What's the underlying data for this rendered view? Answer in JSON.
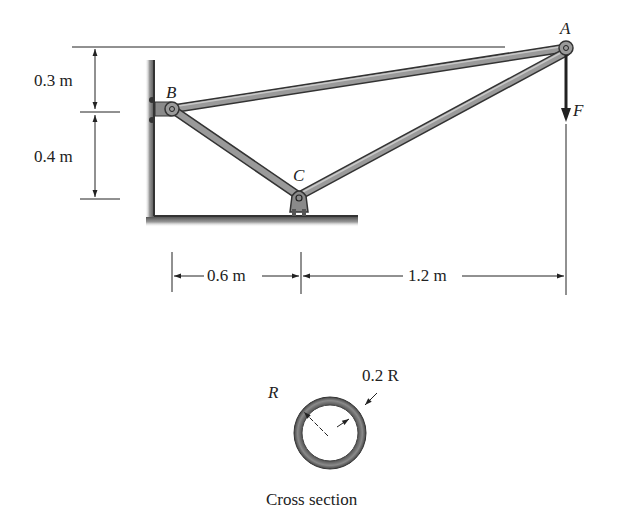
{
  "figure": {
    "type": "truss_frame",
    "points": {
      "A": {
        "label": "A"
      },
      "B": {
        "label": "B"
      },
      "C": {
        "label": "C"
      }
    },
    "load": {
      "label": "F",
      "direction": "down"
    },
    "dimensions": {
      "vertical_top": "0.3 m",
      "vertical_bottom": "0.4 m",
      "horizontal_left": "0.6 m",
      "horizontal_right": "1.2 m"
    },
    "cross_section": {
      "outer_label": "R",
      "thickness_label": "0.2 R",
      "caption": "Cross section"
    }
  },
  "colors": {
    "member": "#8a8a8a",
    "member_dark": "#3a3a3a",
    "ground": "#7a7a7a",
    "line": "#222222"
  }
}
